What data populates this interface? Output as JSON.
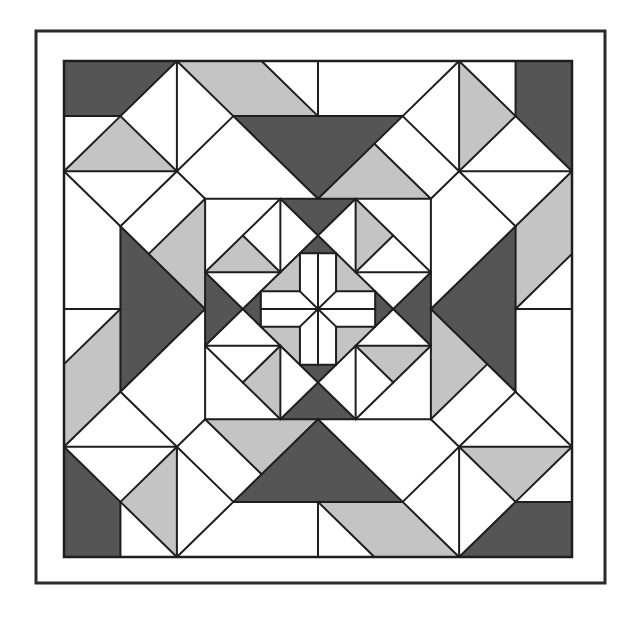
{
  "artwork": {
    "title": "Geometric quilt block",
    "description": "Square quilt pattern with 4-fold rotational symmetry: dark and light gray triangles and parallelograms around a central cross-in-diamond medallion",
    "colors": {
      "background": "#ffffff",
      "white": "#ffffff",
      "light": "#c4c4c4",
      "dark": "#555555",
      "line": "#1e1e1e",
      "frame": "#2a2a2a"
    },
    "frame": {
      "x": 36,
      "y": 31,
      "width": 569,
      "height": 552,
      "stroke_width": 3
    },
    "quilt": {
      "x": 64,
      "y": 61,
      "width": 508,
      "height": 496,
      "units": 9,
      "stroke_width": 2
    },
    "symmetry": {
      "type": "rotational",
      "order": 4,
      "center": [
        4.5,
        4.5
      ],
      "angles": [
        0,
        90,
        180,
        270
      ]
    },
    "quadrant_fills": [
      {
        "name": "corner-dark-piece",
        "fill": "dark",
        "points": [
          [
            0,
            0
          ],
          [
            2,
            0
          ],
          [
            1,
            1
          ],
          [
            0,
            1
          ]
        ]
      },
      {
        "name": "corner-light-triangle",
        "fill": "light",
        "points": [
          [
            1,
            1
          ],
          [
            0,
            2
          ],
          [
            2,
            2
          ]
        ]
      },
      {
        "name": "edge-light-parallelogram",
        "fill": "light",
        "points": [
          [
            2,
            0
          ],
          [
            3.5,
            0
          ],
          [
            4.5,
            1
          ],
          [
            3,
            1
          ]
        ]
      },
      {
        "name": "edge-dark-trapezoid-half",
        "fill": "dark",
        "points": [
          [
            3,
            1
          ],
          [
            4.5,
            1
          ],
          [
            4.5,
            2.5
          ]
        ]
      },
      {
        "name": "side-light-triangle",
        "fill": "light",
        "points": [
          [
            2.5,
            2.5
          ],
          [
            1.5,
            3.5
          ],
          [
            2.5,
            4.5
          ]
        ]
      },
      {
        "name": "side-dark-triangle-half",
        "fill": "dark",
        "points": [
          [
            1,
            3
          ],
          [
            2.5,
            4.5
          ],
          [
            1,
            4.5
          ]
        ]
      },
      {
        "name": "inner-light-triangle",
        "fill": "light",
        "points": [
          [
            3.1667,
            3.1667
          ],
          [
            2.5,
            3.8333
          ],
          [
            3.8333,
            3.8333
          ]
        ]
      },
      {
        "name": "inner-dark-top-half",
        "fill": "dark",
        "points": [
          [
            3.8333,
            2.5
          ],
          [
            4.5,
            2.5
          ],
          [
            4.5,
            3.1667
          ]
        ]
      },
      {
        "name": "inner-dark-left-half",
        "fill": "dark",
        "points": [
          [
            2.5,
            3.8333
          ],
          [
            2.5,
            4.5
          ],
          [
            3.1667,
            4.5
          ]
        ]
      },
      {
        "name": "diamond-tip-dark-top-half",
        "fill": "dark",
        "points": [
          [
            4.18,
            3.4867
          ],
          [
            4.5,
            3.4867
          ],
          [
            4.5,
            3.1667
          ]
        ]
      },
      {
        "name": "diamond-tip-dark-left-half",
        "fill": "dark",
        "points": [
          [
            3.4867,
            4.18
          ],
          [
            3.4867,
            4.5
          ],
          [
            3.1667,
            4.5
          ]
        ]
      },
      {
        "name": "diamond-light-corner",
        "fill": "light",
        "points": [
          [
            3.4867,
            4.18
          ],
          [
            4.18,
            4.18
          ],
          [
            4.18,
            3.4867
          ]
        ]
      }
    ],
    "quadrant_lines": [
      [
        [
          0,
          1
        ],
        [
          1,
          1
        ]
      ],
      [
        [
          2,
          0
        ],
        [
          1,
          1
        ]
      ],
      [
        [
          1,
          1
        ],
        [
          0,
          2
        ]
      ],
      [
        [
          0,
          2
        ],
        [
          2,
          2
        ]
      ],
      [
        [
          1,
          1
        ],
        [
          2,
          2
        ]
      ],
      [
        [
          2,
          0
        ],
        [
          2,
          2
        ]
      ],
      [
        [
          2,
          0
        ],
        [
          3,
          1
        ]
      ],
      [
        [
          3,
          1
        ],
        [
          2,
          2
        ]
      ],
      [
        [
          3.5,
          0
        ],
        [
          4.5,
          1
        ]
      ],
      [
        [
          3,
          1
        ],
        [
          4.5,
          1
        ]
      ],
      [
        [
          4.5,
          0
        ],
        [
          4.5,
          1
        ]
      ],
      [
        [
          3,
          1
        ],
        [
          4.5,
          2.5
        ]
      ],
      [
        [
          2,
          2
        ],
        [
          2.5,
          2.5
        ]
      ],
      [
        [
          0,
          2
        ],
        [
          1,
          3
        ]
      ],
      [
        [
          2,
          2
        ],
        [
          1,
          3
        ]
      ],
      [
        [
          2.5,
          2.5
        ],
        [
          1.5,
          3.5
        ]
      ],
      [
        [
          1,
          3
        ],
        [
          2.5,
          4.5
        ]
      ],
      [
        [
          1,
          3
        ],
        [
          1,
          4.5
        ]
      ],
      [
        [
          0,
          4.5
        ],
        [
          1,
          4.5
        ]
      ],
      [
        [
          2.5,
          2.5
        ],
        [
          4.5,
          2.5
        ]
      ],
      [
        [
          2.5,
          2.5
        ],
        [
          2.5,
          4.5
        ]
      ],
      [
        [
          3.8333,
          2.5
        ],
        [
          3.8333,
          3.8333
        ]
      ],
      [
        [
          2.5,
          3.8333
        ],
        [
          3.8333,
          3.8333
        ]
      ],
      [
        [
          3.8333,
          2.5
        ],
        [
          2.5,
          3.8333
        ]
      ],
      [
        [
          3.1667,
          3.1667
        ],
        [
          3.8333,
          3.8333
        ]
      ],
      [
        [
          3.8333,
          2.5
        ],
        [
          4.5,
          3.1667
        ]
      ],
      [
        [
          2.5,
          3.8333
        ],
        [
          3.1667,
          4.5
        ]
      ],
      [
        [
          4.5,
          3.1667
        ],
        [
          3.1667,
          4.5
        ]
      ],
      [
        [
          4.18,
          3.4867
        ],
        [
          4.18,
          4.18
        ]
      ],
      [
        [
          3.4867,
          4.18
        ],
        [
          4.18,
          4.18
        ]
      ],
      [
        [
          4.18,
          3.4867
        ],
        [
          4.5,
          3.4867
        ]
      ],
      [
        [
          3.4867,
          4.18
        ],
        [
          3.4867,
          4.5
        ]
      ],
      [
        [
          4.5,
          3.4867
        ],
        [
          4.5,
          4.5
        ]
      ],
      [
        [
          3.4867,
          4.5
        ],
        [
          4.5,
          4.5
        ]
      ],
      [
        [
          4.18,
          4.18
        ],
        [
          4.5,
          4.5
        ]
      ]
    ]
  }
}
